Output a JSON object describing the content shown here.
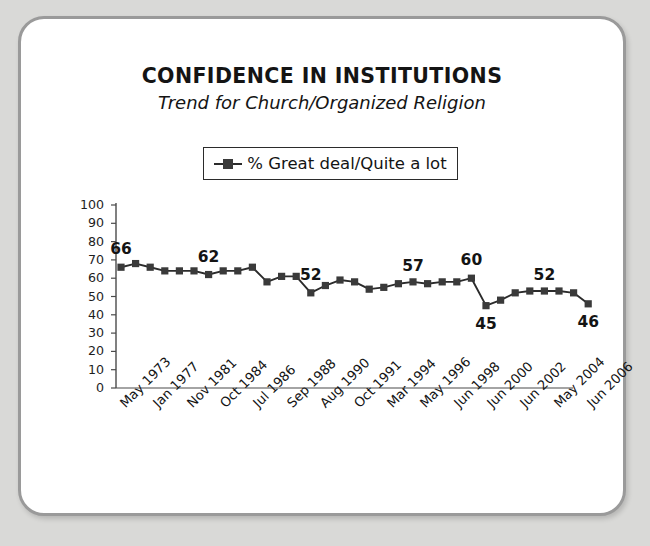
{
  "header": {
    "title": "CONFIDENCE IN INSTITUTIONS",
    "subtitle": "Trend for Church/Organized Religion"
  },
  "legend": {
    "marker_icon": "square-marker-icon",
    "label": "% Great deal/Quite a lot"
  },
  "chart_data": {
    "type": "line",
    "title": "CONFIDENCE IN INSTITUTIONS",
    "subtitle": "Trend for Church/Organized Religion",
    "xlabel": "",
    "ylabel": "",
    "ylim": [
      0,
      100
    ],
    "yticks": [
      0,
      10,
      20,
      30,
      40,
      50,
      60,
      70,
      80,
      90,
      100
    ],
    "grid": false,
    "legend_position": "top-center",
    "legend_entries": [
      "% Great deal/Quite a lot"
    ],
    "marker": "square",
    "line_color": "#2b2b2b",
    "marker_color": "#3a3a3a",
    "tick_labels": [
      "May 1973",
      "Jan 1977",
      "Nov 1981",
      "Oct 1984",
      "Jul 1986",
      "Sep 1988",
      "Aug 1990",
      "Oct 1991",
      "Mar 1994",
      "May 1996",
      "Jun 1998",
      "Jun 2000",
      "Jun 2002",
      "May 2004",
      "Jun 2006"
    ],
    "series": [
      {
        "name": "% Great deal/Quite a lot",
        "values": [
          66,
          68,
          66,
          64,
          64,
          64,
          62,
          64,
          64,
          66,
          58,
          61,
          61,
          52,
          56,
          59,
          58,
          54,
          55,
          57,
          58,
          57,
          58,
          58,
          60,
          45,
          48,
          52,
          53,
          53,
          53,
          52,
          46
        ]
      }
    ],
    "point_labels": [
      {
        "index": 0,
        "value": 66,
        "text": "66"
      },
      {
        "index": 6,
        "value": 62,
        "text": "62"
      },
      {
        "index": 13,
        "value": 52,
        "text": "52"
      },
      {
        "index": 20,
        "value": 57,
        "text": "57"
      },
      {
        "index": 24,
        "value": 60,
        "text": "60"
      },
      {
        "index": 25,
        "value": 45,
        "text": "45"
      },
      {
        "index": 29,
        "value": 52,
        "text": "52"
      },
      {
        "index": 32,
        "value": 46,
        "text": "46"
      }
    ]
  }
}
